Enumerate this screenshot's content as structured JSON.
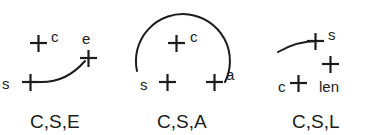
{
  "figure": {
    "background_color": "#ffffff",
    "ink_color": "#1c1c1c",
    "groups": [
      {
        "id": "cse",
        "caption": "C,S,E",
        "description": "curve-start-end",
        "labels": {
          "start": "s",
          "center": "c",
          "end": "e"
        }
      },
      {
        "id": "csa",
        "caption": "C,S,A",
        "description": "circle-start-angle",
        "labels": {
          "start": "s",
          "center": "c",
          "angle": "a"
        }
      },
      {
        "id": "csl",
        "caption": "C,S,L",
        "description": "center-start-length",
        "labels": {
          "center": "c",
          "start": "s",
          "length": "len"
        }
      }
    ]
  }
}
